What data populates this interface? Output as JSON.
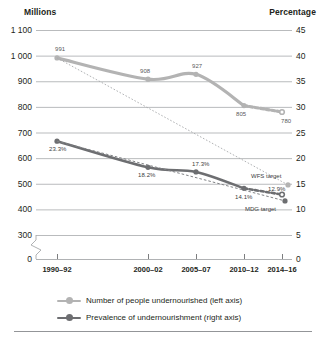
{
  "header": {
    "left_axis_title": "Millions",
    "right_axis_title": "Percentage"
  },
  "legend": {
    "items": [
      {
        "label": "Number of people undernourished (left axis)",
        "color": "#b3b3b3"
      },
      {
        "label": "Prevalence of undernourishment (right axis)",
        "color": "#6d6e71"
      }
    ]
  },
  "annotations": {
    "wfs_target": "WFS target",
    "mdg_target": "MDG target"
  },
  "chart_data": {
    "type": "line",
    "title": "",
    "xlabel": "",
    "ylabel": "Millions",
    "y2label": "Percentage",
    "grid": true,
    "legend_position": "bottom",
    "categories": [
      "1990–92",
      "2000–02",
      "2005–07",
      "2010–12",
      "2014–16"
    ],
    "x_positions_px": [
      57,
      148,
      196,
      244,
      282
    ],
    "ylim": [
      300,
      1100
    ],
    "yticks": [
      "1 100",
      "1 000",
      "900",
      "800",
      "700",
      "600",
      "500",
      "400",
      "300",
      "0"
    ],
    "ytick_values": [
      1100,
      1000,
      900,
      800,
      700,
      600,
      500,
      400,
      300,
      0
    ],
    "y2lim": [
      0,
      45
    ],
    "y2ticks": [
      "45",
      "40",
      "35",
      "30",
      "25",
      "20",
      "15",
      "10",
      "5",
      "0"
    ],
    "y2tick_values": [
      45,
      40,
      35,
      30,
      25,
      20,
      15,
      10,
      5,
      0
    ],
    "axis_break": true,
    "series": [
      {
        "name": "Number of people undernourished (left axis)",
        "axis": "left",
        "color": "#b3b3b3",
        "values": [
          991,
          908,
          927,
          805,
          780
        ],
        "labels": [
          "991",
          "908",
          "927",
          "805",
          "780"
        ],
        "projected_last": true
      },
      {
        "name": "Prevalence of undernourishment (right axis)",
        "axis": "right",
        "color": "#6d6e71",
        "values": [
          23.3,
          18.2,
          17.3,
          14.1,
          12.9
        ],
        "labels": [
          "23.3%",
          "18.2%",
          "17.3%",
          "14.1%",
          "12.9%"
        ],
        "projected_last": true
      }
    ],
    "targets": [
      {
        "name": "WFS target",
        "axis": "left",
        "from": 991,
        "to": 495.5
      },
      {
        "name": "MDG target",
        "axis": "right",
        "from": 23.3,
        "to": 11.65
      }
    ]
  }
}
